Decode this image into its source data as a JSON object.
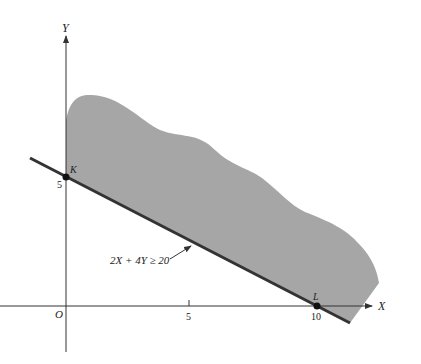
{
  "diagram": {
    "type": "linear-inequality-feasible-region",
    "axes": {
      "x_label": "X",
      "y_label": "Y",
      "origin_label": "O",
      "x_ticks": [
        "5",
        "10"
      ],
      "y_ticks": [
        "5"
      ]
    },
    "constraint": {
      "label": "2X + 4Y ≥ 20",
      "equation": "2X + 4Y = 20"
    },
    "points": [
      {
        "name": "K",
        "x": 0,
        "y": 5,
        "tick_label": "5"
      },
      {
        "name": "L",
        "x": 10,
        "y": 0,
        "tick_label": "10"
      }
    ],
    "colors": {
      "region_fill": "#a6a6a6",
      "boundary_line": "#333333",
      "axis": "#333333",
      "text": "#222222"
    }
  }
}
